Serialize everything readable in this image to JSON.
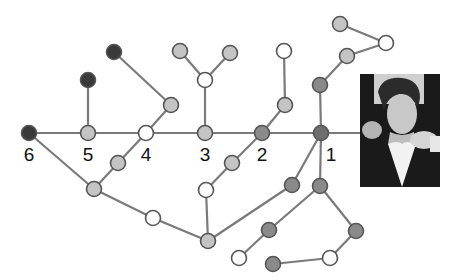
{
  "diagram": {
    "title": "",
    "colors": {
      "dark": "#3a3a3a",
      "medium": "#8a8a8a",
      "light": "#c4c4c4",
      "white": "#ffffff",
      "edge": "#7a7a7a"
    },
    "labels": [
      {
        "id": "n6",
        "text": "6"
      },
      {
        "id": "n5",
        "text": "5"
      },
      {
        "id": "n4",
        "text": "4"
      },
      {
        "id": "n3",
        "text": "3"
      },
      {
        "id": "n2",
        "text": "2"
      },
      {
        "id": "n1",
        "text": "1"
      }
    ],
    "nodes": [
      {
        "id": "n6",
        "x": 29,
        "y": 133,
        "shade": "dark"
      },
      {
        "id": "n5",
        "x": 88,
        "y": 133,
        "shade": "light"
      },
      {
        "id": "n4",
        "x": 146,
        "y": 133,
        "shade": "white"
      },
      {
        "id": "n3",
        "x": 205,
        "y": 133,
        "shade": "light"
      },
      {
        "id": "n2",
        "x": 262,
        "y": 133,
        "shade": "medium"
      },
      {
        "id": "n1",
        "x": 321,
        "y": 133,
        "shade": "medium-dark"
      },
      {
        "id": "a1",
        "x": 88,
        "y": 80,
        "shade": "dark"
      },
      {
        "id": "b1",
        "x": 114,
        "y": 52,
        "shade": "dark"
      },
      {
        "id": "b2",
        "x": 171,
        "y": 105,
        "shade": "light"
      },
      {
        "id": "c1",
        "x": 180,
        "y": 51,
        "shade": "light"
      },
      {
        "id": "c2",
        "x": 230,
        "y": 53,
        "shade": "light"
      },
      {
        "id": "c3",
        "x": 205,
        "y": 80,
        "shade": "white"
      },
      {
        "id": "d1",
        "x": 284,
        "y": 51,
        "shade": "white"
      },
      {
        "id": "d2",
        "x": 285,
        "y": 105,
        "shade": "light"
      },
      {
        "id": "e1",
        "x": 340,
        "y": 24,
        "shade": "light"
      },
      {
        "id": "e2",
        "x": 386,
        "y": 43,
        "shade": "white"
      },
      {
        "id": "e3",
        "x": 347,
        "y": 56,
        "shade": "light"
      },
      {
        "id": "e4",
        "x": 320,
        "y": 85,
        "shade": "medium"
      },
      {
        "id": "f1",
        "x": 232,
        "y": 163,
        "shade": "light"
      },
      {
        "id": "f2",
        "x": 206,
        "y": 190,
        "shade": "white"
      },
      {
        "id": "g1",
        "x": 208,
        "y": 241,
        "shade": "light"
      },
      {
        "id": "h1",
        "x": 292,
        "y": 185,
        "shade": "medium"
      },
      {
        "id": "i1",
        "x": 320,
        "y": 186,
        "shade": "medium"
      },
      {
        "id": "i2",
        "x": 269,
        "y": 230,
        "shade": "medium"
      },
      {
        "id": "i3",
        "x": 239,
        "y": 258,
        "shade": "white"
      },
      {
        "id": "j1",
        "x": 356,
        "y": 231,
        "shade": "medium"
      },
      {
        "id": "j2",
        "x": 330,
        "y": 258,
        "shade": "white"
      },
      {
        "id": "j3",
        "x": 273,
        "y": 264,
        "shade": "medium"
      },
      {
        "id": "k1",
        "x": 118,
        "y": 163,
        "shade": "light"
      },
      {
        "id": "k2",
        "x": 94,
        "y": 189,
        "shade": "light"
      },
      {
        "id": "k3",
        "x": 153,
        "y": 218,
        "shade": "white"
      }
    ],
    "edges": [
      [
        "n6",
        "n5"
      ],
      [
        "n5",
        "n4"
      ],
      [
        "n4",
        "n3"
      ],
      [
        "n3",
        "n2"
      ],
      [
        "n2",
        "n1"
      ],
      [
        "n1",
        "photo"
      ],
      [
        "n5",
        "a1"
      ],
      [
        "b1",
        "b2"
      ],
      [
        "b2",
        "n4"
      ],
      [
        "c1",
        "c3"
      ],
      [
        "c2",
        "c3"
      ],
      [
        "c3",
        "n3"
      ],
      [
        "d1",
        "d2"
      ],
      [
        "d2",
        "n2"
      ],
      [
        "e1",
        "e2"
      ],
      [
        "e2",
        "e3"
      ],
      [
        "e3",
        "e4"
      ],
      [
        "e4",
        "n1"
      ],
      [
        "n2",
        "f1"
      ],
      [
        "f1",
        "f2"
      ],
      [
        "f2",
        "g1"
      ],
      [
        "n1",
        "h1"
      ],
      [
        "h1",
        "g1"
      ],
      [
        "n1",
        "i1"
      ],
      [
        "i1",
        "i2"
      ],
      [
        "i2",
        "i3"
      ],
      [
        "i1",
        "j1"
      ],
      [
        "j1",
        "j2"
      ],
      [
        "j2",
        "j3"
      ],
      [
        "n6",
        "k2"
      ],
      [
        "n4",
        "k1"
      ],
      [
        "k1",
        "k2"
      ],
      [
        "k2",
        "k3"
      ],
      [
        "k3",
        "g1"
      ]
    ],
    "photo": {
      "description": "photo of a man in a dark jacket pointing at the viewer",
      "x": 360,
      "y": 74,
      "width": 80,
      "height": 113
    }
  }
}
